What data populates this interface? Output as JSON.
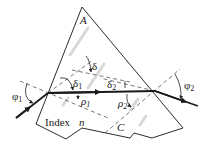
{
  "figure": {
    "labels": {
      "apex": "A",
      "deviation": "δ",
      "delta1": "δ",
      "delta1_sub": "1",
      "delta2": "δ",
      "delta2_sub": "2",
      "rho1": "ρ",
      "rho1_sub": "1",
      "rho2": "ρ",
      "rho2_sub": "2",
      "phi1": "φ",
      "phi1_sub": "1",
      "phi2": "φ",
      "phi2_sub": "2",
      "index_text": "Index",
      "index_symbol": "n",
      "corner": "C"
    },
    "colors": {
      "line": "#2b2b2b",
      "ray": "#1a1a1a",
      "background": "#ffffff"
    }
  }
}
